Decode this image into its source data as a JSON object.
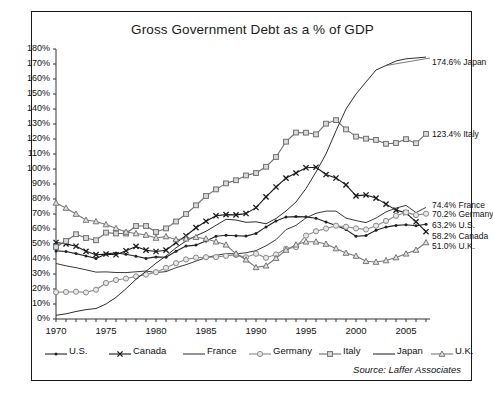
{
  "chart_data": {
    "type": "line",
    "title": "Gross Government Debt as a % of GDP",
    "xlabel": "",
    "ylabel": "",
    "source": "Source: Laffer Associates",
    "grid": false,
    "legend_position": "bottom",
    "xlim": [
      1970,
      2007
    ],
    "ylim": [
      0,
      180
    ],
    "ytick_step": 10,
    "xtick_step": 1,
    "ytick_labels": [
      "0%",
      "10%",
      "20%",
      "30%",
      "40%",
      "50%",
      "60%",
      "70%",
      "80%",
      "90%",
      "100%",
      "110%",
      "120%",
      "130%",
      "140%",
      "150%",
      "160%",
      "170%",
      "180%"
    ],
    "xtick_labels": [
      "1970",
      "1975",
      "1980",
      "1985",
      "1990",
      "1995",
      "2000",
      "2005"
    ],
    "xtick_label_years": [
      1970,
      1975,
      1980,
      1985,
      1990,
      1995,
      2000,
      2005
    ],
    "x": [
      1970,
      1971,
      1972,
      1973,
      1974,
      1975,
      1976,
      1977,
      1978,
      1979,
      1980,
      1981,
      1982,
      1983,
      1984,
      1985,
      1986,
      1987,
      1988,
      1989,
      1990,
      1991,
      1992,
      1993,
      1994,
      1995,
      1996,
      1997,
      1998,
      1999,
      2000,
      2001,
      2002,
      2003,
      2004,
      2005,
      2006,
      2007
    ],
    "series": [
      {
        "name": "U.S.",
        "marker": "dot",
        "color": "#222222",
        "end_label": "63.2% U.S.",
        "end_value": 63.2,
        "values": [
          45.4,
          45.0,
          43.6,
          42.0,
          40.4,
          43.4,
          44.0,
          43.2,
          41.8,
          40.4,
          41.4,
          41.2,
          45.2,
          48.6,
          49.3,
          52.0,
          55.2,
          55.8,
          55.5,
          55.3,
          57.0,
          61.4,
          65.3,
          68.0,
          68.3,
          68.1,
          67.2,
          64.7,
          62.3,
          59.6,
          55.2,
          55.6,
          59.1,
          61.3,
          62.4,
          62.8,
          62.1,
          63.2
        ]
      },
      {
        "name": "Canada",
        "marker": "x",
        "color": "#1b1b1b",
        "end_label": "58.2% Canada",
        "end_value": 58.2,
        "values": [
          51.0,
          50.1,
          48.5,
          45.1,
          42.9,
          43.3,
          42.8,
          45.5,
          48.4,
          45.9,
          45.0,
          45.9,
          50.9,
          55.5,
          60.9,
          65.2,
          68.8,
          69.6,
          69.4,
          70.3,
          74.3,
          81.4,
          88.0,
          93.9,
          97.3,
          100.8,
          101.2,
          96.3,
          94.0,
          89.4,
          82.1,
          82.7,
          80.6,
          76.6,
          72.6,
          70.8,
          64.8,
          58.2
        ]
      },
      {
        "name": "France",
        "marker": "none",
        "color": "#3a3a3a",
        "end_label": "74.4% France",
        "end_value": 74.4,
        "values": [
          37.0,
          35.5,
          34.2,
          32.8,
          31.3,
          31.4,
          31.0,
          30.9,
          31.5,
          32.0,
          30.9,
          31.6,
          34.2,
          36.2,
          38.6,
          40.9,
          42.4,
          43.6,
          43.5,
          44.1,
          45.6,
          48.8,
          52.9,
          59.6,
          62.4,
          67.4,
          70.5,
          71.9,
          71.9,
          67.3,
          65.6,
          64.3,
          67.3,
          71.4,
          73.9,
          75.7,
          70.9,
          74.4
        ]
      },
      {
        "name": "Germany",
        "marker": "circle",
        "color": "#8a8a8a",
        "end_label": "70.2% Germany",
        "end_value": 70.2,
        "values": [
          17.9,
          18.0,
          18.2,
          17.7,
          19.5,
          24.0,
          26.0,
          27.0,
          28.4,
          29.6,
          31.2,
          34.1,
          37.2,
          39.7,
          40.9,
          41.2,
          41.3,
          42.1,
          42.7,
          41.1,
          43.5,
          40.8,
          43.0,
          46.8,
          47.9,
          55.6,
          58.5,
          60.3,
          62.2,
          61.5,
          60.4,
          59.7,
          62.2,
          65.4,
          68.8,
          71.1,
          69.3,
          70.2
        ]
      },
      {
        "name": "Italy",
        "marker": "square",
        "color": "#6e6e6e",
        "end_label": "123.4% Italy",
        "end_value": 123.4,
        "values": [
          48.0,
          52.0,
          56.5,
          54.0,
          52.5,
          57.6,
          57.0,
          57.0,
          62.0,
          62.0,
          58.0,
          60.4,
          65.0,
          70.0,
          75.8,
          82.0,
          86.4,
          90.4,
          92.5,
          95.7,
          97.3,
          101.5,
          108.0,
          118.2,
          124.3,
          124.2,
          123.1,
          130.2,
          132.6,
          126.4,
          121.6,
          120.2,
          119.4,
          116.8,
          117.3,
          119.9,
          117.2,
          123.4
        ]
      },
      {
        "name": "Japan",
        "marker": "none",
        "color": "#2e2e2e",
        "end_label": "174.6% Japan",
        "end_value": 174.6,
        "values": [
          2.5,
          3.5,
          5.0,
          6.3,
          7.0,
          10.0,
          14.4,
          20.2,
          26.5,
          31.8,
          37.2,
          42.0,
          47.5,
          52.0,
          55.5,
          58.5,
          62.5,
          66.5,
          66.0,
          64.5,
          64.8,
          63.5,
          67.0,
          72.0,
          78.0,
          87.0,
          98.0,
          110.0,
          125.5,
          140.0,
          150.0,
          158.0,
          166.0,
          169.0,
          172.0,
          173.5,
          174.0,
          174.6
        ]
      },
      {
        "name": "U.K.",
        "marker": "triangle",
        "color": "#767676",
        "end_label": "51.0% U.K.",
        "end_value": 51.0,
        "values": [
          77.4,
          74.0,
          70.0,
          66.0,
          65.0,
          63.0,
          60.5,
          58.0,
          57.0,
          56.0,
          54.0,
          55.0,
          53.0,
          53.5,
          54.5,
          53.5,
          51.5,
          49.5,
          43.5,
          39.5,
          34.4,
          35.5,
          40.5,
          46.0,
          49.5,
          51.5,
          51.5,
          50.0,
          47.0,
          44.0,
          42.0,
          38.5,
          38.0,
          39.0,
          41.0,
          43.5,
          46.0,
          51.0
        ]
      }
    ],
    "legend_entries": [
      {
        "label": "U.S.",
        "marker": "dot",
        "color": "#222222"
      },
      {
        "label": "Canada",
        "marker": "x",
        "color": "#1b1b1b"
      },
      {
        "label": "France",
        "marker": "none",
        "color": "#3a3a3a"
      },
      {
        "label": "Germany",
        "marker": "circle",
        "color": "#8a8a8a"
      },
      {
        "label": "Italy",
        "marker": "square",
        "color": "#6e6e6e"
      },
      {
        "label": "Japan",
        "marker": "none",
        "color": "#2e2e2e"
      },
      {
        "label": "U.K.",
        "marker": "triangle",
        "color": "#767676"
      }
    ]
  }
}
